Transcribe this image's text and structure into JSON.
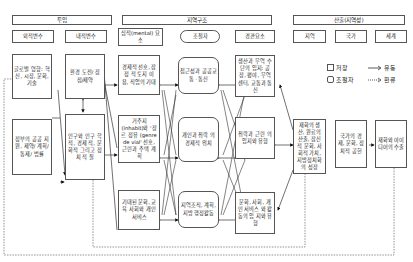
{
  "headers": {
    "input": "투입",
    "regional_structure": "지역구조",
    "output": "산출(지역성)"
  },
  "subheaders": {
    "external_vars": "외적변수",
    "internal_vars": "내적변수",
    "mental_elements": "심적(mental) 요소",
    "regulator": "조절자",
    "landscape_elements": "경관요소",
    "region": "지역",
    "nation": "국가",
    "world": "세계"
  },
  "boxes": {
    "global_influence": "글로벌 영향: 혁신, 시장, 문화, 기술",
    "gov_support": "정부의 공공 지원, 제약/ 계획/통제/ 법률",
    "env_challenge": "환경 도전/ 잠점/제약",
    "population": "인구와 인구 학적, 경제 적, 문화적 그리고 정치 적 질",
    "economic_choice": "경제적 선호, 잠정 적 토지 이 용, 직업의 기대",
    "residence": "거주지 (inhabit)와 '장르 정유 (genre de vial' 선호, 근린과 주택 계획",
    "expected_culture": "기대된 문화, 교육 사회와 개인 서비스",
    "accessibility": "접근성과 공공교통 · 통신",
    "personal_position": "개인과 취락 의 경제적 위치",
    "regional_org": "지역조직, 계획, 지방 행정활동",
    "production_location": "생산과 무역 수단의 입지: 공장, 평야, 무역 센터, 교통과 통신",
    "settlement_type": "취락과 근린 의 입지와 유형",
    "culture_social": "문화, 사회, 개인 서비스 와 활동의 입 지와 유형",
    "wealth_production": "재화의 생 산, 원료의 산출, 잠신 적 문화, 사 회적 가치, 지방정치화 의 성장",
    "national_economy": "국가의 경제, 문화, 정치적 공헌",
    "world_export": "재화와 아이 디어의 수출"
  },
  "legend": {
    "storage_label": "저장",
    "regulator_label": "조절자",
    "flow_label": "유동",
    "feedback_label": "환류"
  }
}
